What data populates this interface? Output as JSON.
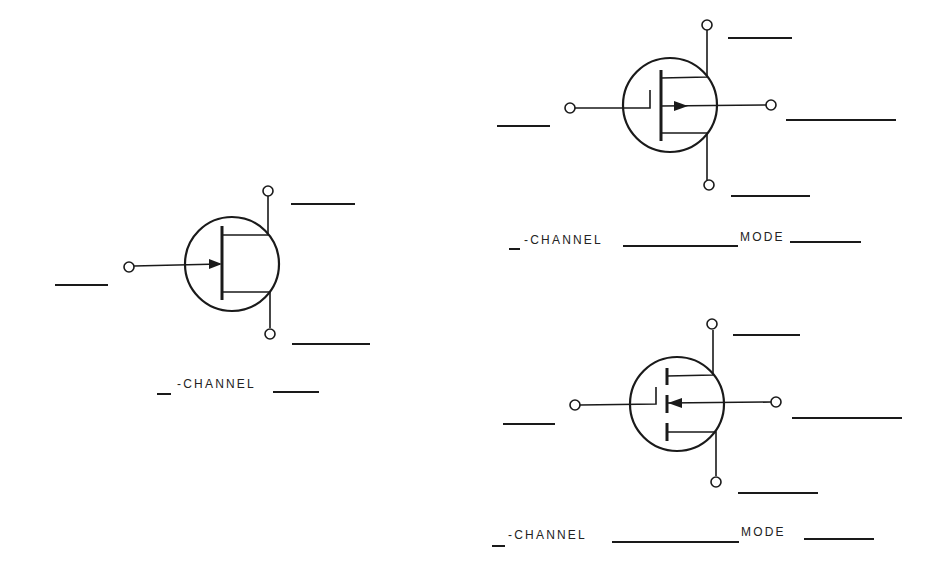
{
  "worksheet": {
    "title": "FET symbol identification worksheet",
    "symbols": [
      {
        "id": "jfet",
        "type": "JFET",
        "label": {
          "prefix_blank": "",
          "text": "-CHANNEL",
          "suffix_blank": ""
        },
        "terminal_blanks": [
          "gate",
          "drain",
          "source"
        ]
      },
      {
        "id": "mosfet-depletion",
        "type": "MOSFET (continuous channel)",
        "label": {
          "prefix_blank": "",
          "text": "-CHANNEL",
          "middle_blank": "",
          "mode_text": "MODE",
          "suffix_blank": ""
        },
        "terminal_blanks": [
          "gate",
          "drain",
          "substrate",
          "source"
        ]
      },
      {
        "id": "mosfet-enhancement",
        "type": "MOSFET (segmented channel)",
        "label": {
          "prefix_blank": "",
          "text": "-CHANNEL",
          "middle_blank": "",
          "mode_text": "MODE",
          "suffix_blank": ""
        },
        "terminal_blanks": [
          "gate",
          "drain",
          "substrate",
          "source"
        ]
      }
    ],
    "labels": {
      "channel": "-CHANNEL",
      "mode": "MODE"
    },
    "colors": {
      "ink": "#1a1a1a",
      "paper": "#ffffff"
    }
  }
}
